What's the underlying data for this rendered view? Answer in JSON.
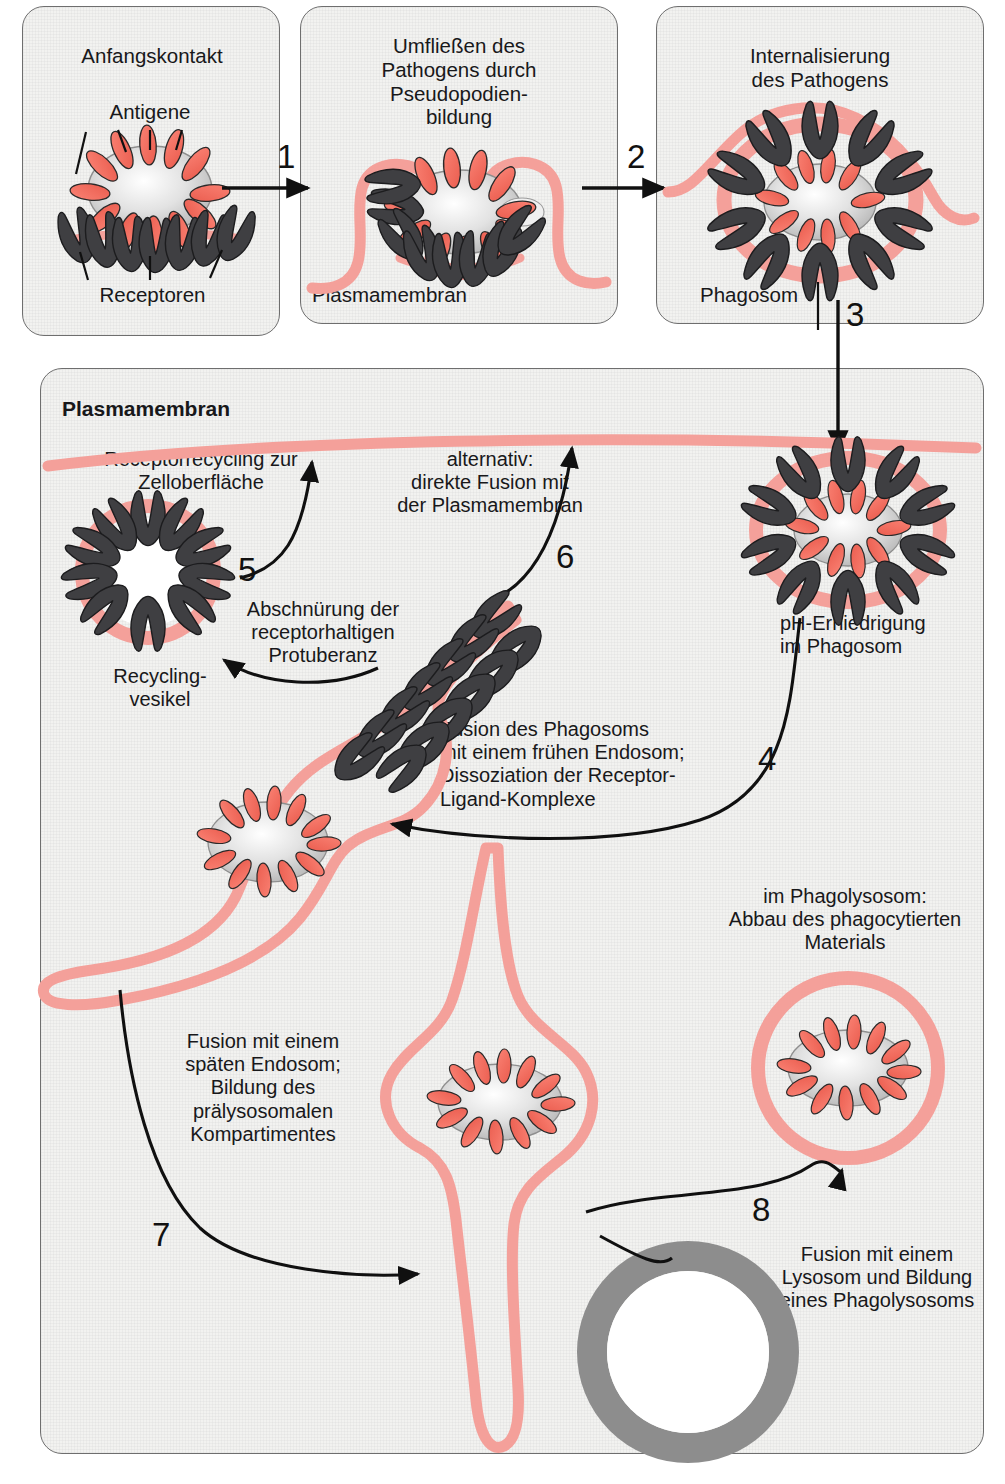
{
  "diagram": {
    "title_bold": "Plasmamembran",
    "language": "de",
    "colors": {
      "membrane_pink": "#f4a09a",
      "antigen_red": "#f4685c",
      "receptor_dark": "#3f3f42",
      "lysosome_gray": "#8d8d8d",
      "panel_bg": "#f2f2f0",
      "panel_border": "#6e6e6e",
      "text": "#18181a"
    }
  },
  "top_panels": [
    {
      "id": "panel-1",
      "title": "Anfangskontakt",
      "labels": {
        "antigene": "Antigene",
        "pathogen": "Pathogen",
        "receptoren": "Receptoren"
      }
    },
    {
      "id": "panel-2",
      "title": "Umfließen des\nPathogens durch\nPseudopodien-\nbildung",
      "labels": {
        "plasmamembran": "Plasmamembran"
      }
    },
    {
      "id": "panel-3",
      "title": "Internalisierung\ndes Pathogens",
      "labels": {
        "phagosom": "Phagosom"
      }
    }
  ],
  "steps": {
    "s1": "1",
    "s2": "2",
    "s3": "3",
    "s4": "4",
    "s5": "5",
    "s6": "6",
    "s7": "7",
    "s8": "8"
  },
  "main_panel": {
    "plasmamembran": "Plasmamembran",
    "receptorrecycling": "Receptorrecycling zur\nZelloberfläche",
    "alternativ": "alternativ:\ndirekte Fusion mit\nder Plasmamembran",
    "abschnuerung": "Abschnürung der\nreceptorhaltigen\nProtuberanz",
    "recycling_vesikel": "Recycling-\nvesikel",
    "ph_erniedrigung": "pH-Erniedrigung\nim Phagosom",
    "fusion_phagosom": "Fusion des Phagosoms\nmit einem frühen Endosom;\nDissoziation der Receptor-\nLigand-Komplexe",
    "fusion_spaeten": "Fusion mit einem\nspäten Endosom;\nBildung des\nprälysosomalen\nKompartimentes",
    "im_phagolysosom": "im Phagolysosom:\nAbbau des phagocytierten\nMaterials",
    "fusion_lysosom": "Fusion mit einem\nLysosom und Bildung\neines Phagolysosoms",
    "lysosom": "Lysosom"
  }
}
